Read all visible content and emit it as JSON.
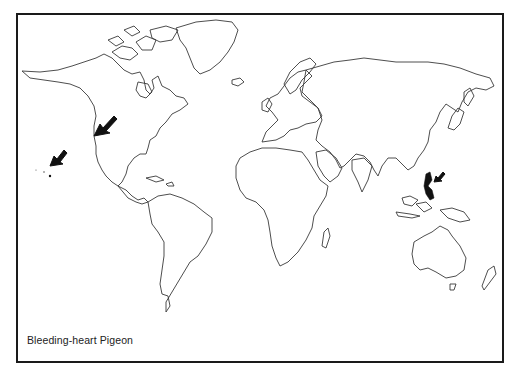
{
  "map": {
    "title": "Bleeding-heart Pigeon",
    "projection": "world outline map",
    "frame_color": "#1a1a1a",
    "coastline_color": "#3a3a3a",
    "range_color": "#111111",
    "markers": [
      {
        "name": "arrow-hawaii",
        "label": "Hawaii (introduced)"
      },
      {
        "name": "arrow-west-coast-north-america",
        "label": "Pacific Northwest North America"
      },
      {
        "name": "arrow-philippines",
        "label": "Philippines (native range)"
      }
    ]
  }
}
